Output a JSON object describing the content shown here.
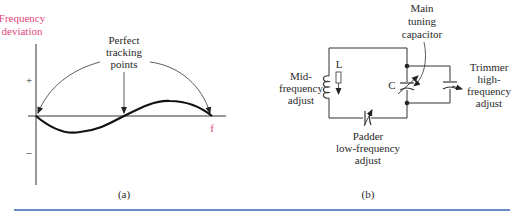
{
  "panel_a": {
    "y_axis_label_line1": "Frequency",
    "y_axis_label_line2": "deviation",
    "plus_sign": "+",
    "minus_sign": "–",
    "x_axis_label": "f",
    "annotation_line1": "Perfect",
    "annotation_line2": "tracking",
    "annotation_line3": "points",
    "caption": "(a)",
    "label_color": "#e0457b"
  },
  "panel_b": {
    "inductor_label": "L",
    "capacitor_label": "C",
    "mid_label_line1": "Mid-",
    "mid_label_line2": "frequency",
    "mid_label_line3": "adjust",
    "main_label_line1": "Main",
    "main_label_line2": "tuning",
    "main_label_line3": "capacitor",
    "trimmer_label_line1": "Trimmer",
    "trimmer_label_line2": "high-",
    "trimmer_label_line3": "frequency",
    "trimmer_label_line4": "adjust",
    "padder_label_line1": "Padder",
    "padder_label_line2": "low-frequency",
    "padder_label_line3": "adjust",
    "caption": "(b)"
  },
  "footer_rule_color": "#3a63b8"
}
